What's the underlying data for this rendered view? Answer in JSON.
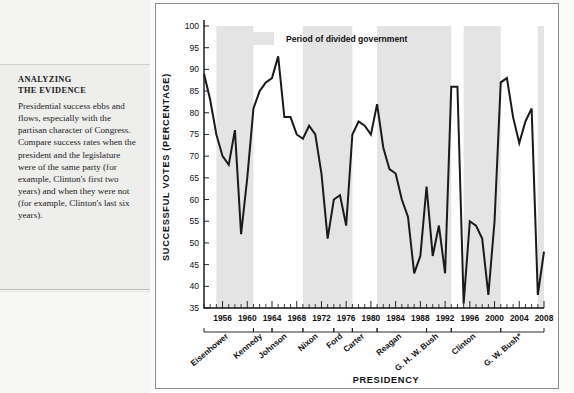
{
  "sidebar": {
    "heading_line1": "ANALYZING",
    "heading_line2": "THE EVIDENCE",
    "body": "Presidential success ebbs and flows, especially with the partisan character of Congress. Compare success rates when the president and the legislature were of the same party (for example, Clinton's first two years) and when they were not (for example, Clinton's last six years)."
  },
  "chart_data": {
    "type": "line",
    "title": "",
    "xlabel": "PRESIDENCY",
    "ylabel": "SUCCESSFUL VOTES (PERCENTAGE)",
    "ylim": [
      35,
      100
    ],
    "xlim": [
      1953,
      2008
    ],
    "ytick_step": 5,
    "yticks": [
      35,
      40,
      45,
      50,
      55,
      60,
      65,
      70,
      75,
      80,
      85,
      90,
      95,
      100
    ],
    "xticks_labeled": [
      1956,
      1960,
      1964,
      1968,
      1972,
      1976,
      1980,
      1984,
      1988,
      1992,
      1996,
      2000,
      2004,
      2008
    ],
    "xtick_minor_step": 1,
    "grid": false,
    "legend": {
      "position": "top-center",
      "entries": [
        {
          "label": "Period of divided government",
          "color": "#e4e4e4",
          "type": "shaded-band"
        }
      ]
    },
    "series": [
      {
        "name": "Presidential success rate on congressional votes",
        "color": "#1a1a1a",
        "x": [
          1953,
          1954,
          1955,
          1956,
          1957,
          1958,
          1959,
          1960,
          1961,
          1962,
          1963,
          1964,
          1965,
          1966,
          1967,
          1968,
          1969,
          1970,
          1971,
          1972,
          1973,
          1974,
          1975,
          1976,
          1977,
          1978,
          1979,
          1980,
          1981,
          1982,
          1983,
          1984,
          1985,
          1986,
          1987,
          1988,
          1989,
          1990,
          1991,
          1992,
          1993,
          1994,
          1995,
          1996,
          1997,
          1998,
          1999,
          2000,
          2001,
          2002,
          2003,
          2004,
          2005,
          2006,
          2007,
          2008
        ],
        "values": [
          89,
          83,
          75,
          70,
          68,
          76,
          52,
          65,
          81,
          85,
          87,
          88,
          93,
          79,
          79,
          75,
          74,
          77,
          75,
          66,
          51,
          60,
          61,
          54,
          75,
          78,
          77,
          75,
          82,
          72,
          67,
          66,
          60,
          56,
          43,
          47,
          63,
          47,
          54,
          43,
          86,
          86,
          36,
          55,
          54,
          51,
          38,
          55,
          87,
          88,
          79,
          73,
          78,
          81,
          38,
          48
        ]
      }
    ],
    "shaded_bands": [
      {
        "label": "divided government",
        "start": 1955,
        "end": 1961
      },
      {
        "label": "divided government",
        "start": 1969,
        "end": 1977
      },
      {
        "label": "divided government",
        "start": 1981,
        "end": 1993
      },
      {
        "label": "divided government",
        "start": 1995,
        "end": 2001
      },
      {
        "label": "divided government",
        "start": 2007,
        "end": 2009
      }
    ],
    "presidents": [
      {
        "name": "Eisenhower",
        "start": 1953,
        "end": 1961
      },
      {
        "name": "Kennedy",
        "start": 1961,
        "end": 1964
      },
      {
        "name": "Johnson",
        "start": 1964,
        "end": 1969
      },
      {
        "name": "Nixon",
        "start": 1969,
        "end": 1974
      },
      {
        "name": "Ford",
        "start": 1974,
        "end": 1977
      },
      {
        "name": "Carter",
        "start": 1977,
        "end": 1981
      },
      {
        "name": "Reagan",
        "start": 1981,
        "end": 1989
      },
      {
        "name": "G. H. W. Bush",
        "start": 1989,
        "end": 1993
      },
      {
        "name": "Clinton",
        "start": 1993,
        "end": 2001
      },
      {
        "name": "G. W. Bush*",
        "start": 2001,
        "end": 2009
      }
    ]
  }
}
